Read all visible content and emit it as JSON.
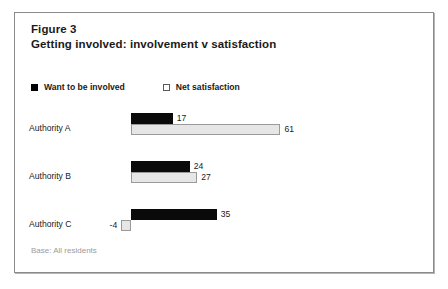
{
  "figure": {
    "title_line1": "Figure 3",
    "title_line2": "Getting involved: involvement v satisfaction",
    "note": "Base: All residents"
  },
  "legend": {
    "items": [
      {
        "label": "Want to be involved",
        "marker": "filled-square-icon",
        "color": "#0a0a0a"
      },
      {
        "label": "Net satisfaction",
        "marker": "open-square-icon",
        "color": "#e6e6e6"
      }
    ]
  },
  "chart_data": {
    "type": "bar",
    "orientation": "horizontal",
    "title": "Getting involved: involvement v satisfaction",
    "xlabel": "",
    "ylabel": "",
    "categories": [
      "Authority A",
      "Authority B",
      "Authority C"
    ],
    "series": [
      {
        "name": "Want to be involved",
        "values": [
          17,
          24,
          35
        ],
        "color": "#0a0a0a"
      },
      {
        "name": "Net satisfaction",
        "values": [
          61,
          27,
          -4
        ],
        "color": "#e6e6e6"
      }
    ],
    "value_labels": [
      [
        "17",
        "61"
      ],
      [
        "24",
        "27"
      ],
      [
        "35",
        "-4"
      ]
    ],
    "xlim": [
      -10,
      70
    ],
    "zero_baseline": 0,
    "grid": false,
    "legend_position": "top-left",
    "annotation": "Base: All residents"
  }
}
